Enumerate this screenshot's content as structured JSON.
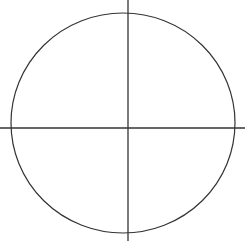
{
  "canvas": {
    "width": 247,
    "height": 241,
    "background_color": "#ffffff",
    "title": "Circle with crosshair axes"
  },
  "style": {
    "stroke_color": "#333338",
    "circle_stroke_width": 1.2,
    "axis_stroke_width": 1.3,
    "fill": "none"
  },
  "chart_data": {
    "type": "scatter",
    "title": "",
    "subtitle": "",
    "xlabel": "",
    "ylabel": "",
    "grid": false,
    "legend": null,
    "legend_position": "none",
    "annotations": [],
    "tick_labels_x": [],
    "tick_labels_y": [],
    "axis_origin": {
      "x": 128,
      "y": 128
    },
    "xlim": [
      0,
      247
    ],
    "ylim": [
      0,
      241
    ],
    "shapes": [
      {
        "name": "circle-outline",
        "kind": "ellipse",
        "center_x": 123,
        "center_y": 123,
        "radius_x": 112,
        "radius_y": 110,
        "stroke": "#333338",
        "stroke_width": 1.2,
        "fill": "none"
      },
      {
        "name": "vertical-axis",
        "kind": "line",
        "x1": 128,
        "y1": 0,
        "x2": 128,
        "y2": 241,
        "stroke": "#333338",
        "stroke_width": 1.3
      },
      {
        "name": "horizontal-axis",
        "kind": "line",
        "x1": 0,
        "y1": 128,
        "x2": 245,
        "y2": 128,
        "stroke": "#333338",
        "stroke_width": 1.3
      }
    ]
  },
  "labels": {
    "figure_caption": "",
    "circle_label": "",
    "x_axis_label": "",
    "y_axis_label": "",
    "origin_label": ""
  }
}
